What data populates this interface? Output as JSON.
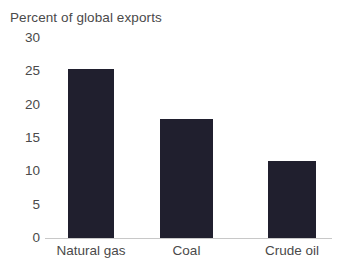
{
  "chart_data": {
    "type": "bar",
    "title": "Percent of global exports",
    "xlabel": "",
    "ylabel": "",
    "categories": [
      "Natural gas",
      "Coal",
      "Crude oil"
    ],
    "values": [
      25.3,
      17.9,
      11.6
    ],
    "ylim": [
      0,
      30
    ],
    "yticks": [
      30,
      25,
      20,
      15,
      10,
      5,
      0
    ],
    "ytick_labels": [
      "30",
      "25",
      "20",
      "15",
      "10",
      "5",
      "0"
    ],
    "grid": false,
    "legend": null,
    "bar_color": "#201f2e",
    "axis_color": "#c8c8c8",
    "text_color": "#4a4a4a",
    "background_color": "#ffffff"
  }
}
